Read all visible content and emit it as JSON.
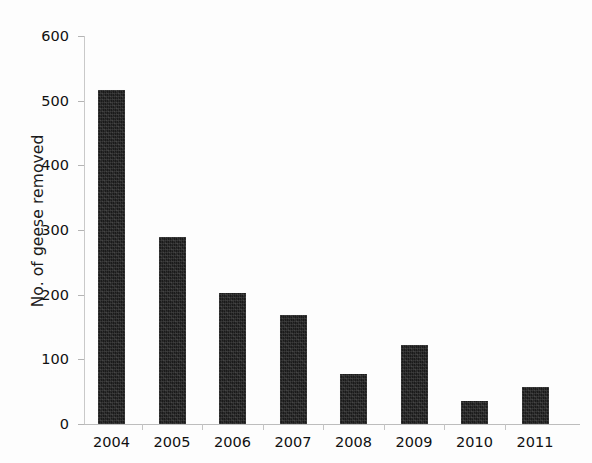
{
  "chart_data": {
    "type": "bar",
    "title": "",
    "subtitle": "",
    "xlabel": "",
    "ylabel": "No. of geese removed",
    "categories": [
      "2004",
      "2005",
      "2006",
      "2007",
      "2008",
      "2009",
      "2010",
      "2011"
    ],
    "values": [
      517,
      289,
      202,
      168,
      78,
      122,
      35,
      58
    ],
    "ylim": [
      0,
      600
    ],
    "yticks": [
      0,
      100,
      200,
      300,
      400,
      500,
      600
    ],
    "ytick_labels": [
      "0",
      "100",
      "200",
      "300",
      "400",
      "500",
      "600"
    ],
    "grid": false,
    "legend": null,
    "legend_position": "none",
    "bar_color": "#1a1a1a",
    "axis_color": "#bdbdbd",
    "background_color": "#ffffff",
    "annotations": []
  }
}
